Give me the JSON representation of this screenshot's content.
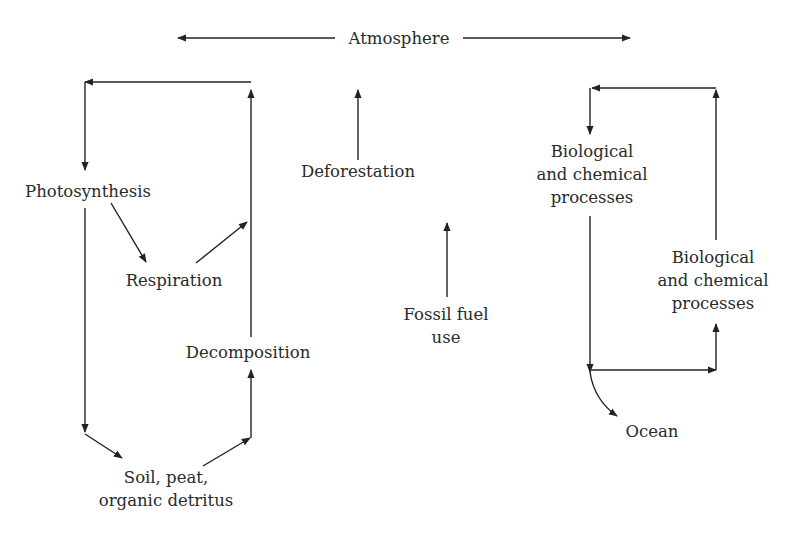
{
  "diagram": {
    "title": "",
    "colors": {
      "line": "#222222",
      "text": "#2a2a2a",
      "background": "#ffffff"
    },
    "nodes": {
      "atmosphere": "Atmosphere",
      "photosynthesis": "Photosynthesis",
      "respiration": "Respiration",
      "decomposition": "Decomposition",
      "soil": {
        "line1": "Soil, peat,",
        "line2": "organic detritus"
      },
      "deforestation": "Deforestation",
      "fossil_fuel": {
        "line1": "Fossil fuel",
        "line2": "use"
      },
      "bio_chem_1": {
        "line1": "Biological",
        "line2": "and chemical",
        "line3": "processes"
      },
      "bio_chem_2": {
        "line1": "Biological",
        "line2": "and chemical",
        "line3": "processes"
      },
      "ocean": "Ocean"
    },
    "edges": [
      {
        "from": "Atmosphere",
        "to": "left (terrestrial)",
        "style": "double-arrow"
      },
      {
        "from": "Atmosphere",
        "to": "right (ocean)",
        "style": "double-arrow"
      },
      {
        "from": "Atmosphere",
        "to": "Photosynthesis"
      },
      {
        "from": "Photosynthesis",
        "to": "Respiration"
      },
      {
        "from": "Respiration",
        "to": "Atmosphere"
      },
      {
        "from": "Photosynthesis",
        "to": "Soil, peat, organic detritus"
      },
      {
        "from": "Soil, peat, organic detritus",
        "to": "Decomposition"
      },
      {
        "from": "Decomposition",
        "to": "Atmosphere"
      },
      {
        "from": "Deforestation",
        "to": "Atmosphere"
      },
      {
        "from": "Fossil fuel use",
        "to": "Atmosphere"
      },
      {
        "from": "Atmosphere",
        "to": "Biological and chemical processes (1)"
      },
      {
        "from": "Biological and chemical processes (1)",
        "to": "Ocean"
      },
      {
        "from": "Biological and chemical processes (1)",
        "to": "Biological and chemical processes (2)"
      },
      {
        "from": "Biological and chemical processes (2)",
        "to": "Atmosphere"
      }
    ]
  }
}
